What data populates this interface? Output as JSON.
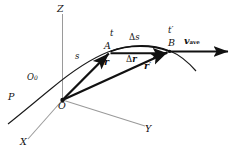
{
  "figure": {
    "type": "physics-vector-diagram",
    "background_color": "#ffffff",
    "line_color": "#111111",
    "axis_color": "#9a9a9a"
  },
  "axes": {
    "z_label": "Z",
    "y_label": "Y",
    "x_label": "X"
  },
  "points": {
    "origin_label": "O",
    "path_origin_label": "O",
    "path_origin_sub": "0",
    "point_a_label": "A",
    "point_b_label": "B",
    "path_label": "P"
  },
  "times": {
    "time_a": "t",
    "time_b": "t",
    "time_b_prime": "′"
  },
  "vectors": {
    "r_label": "r",
    "r_prime_label": "r",
    "r_prime_mark": "′",
    "delta_r_symbol": "Δ",
    "delta_r_label": "r",
    "v_ave_label": "v",
    "v_ave_sub": "ave"
  },
  "arc": {
    "arc_length_symbol": "Δ",
    "arc_length_label": "s",
    "s_label": "s"
  }
}
